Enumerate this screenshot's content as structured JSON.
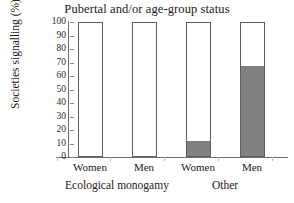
{
  "chart_data": {
    "type": "bar",
    "title": "Pubertal and/or age-group status",
    "xlabel": "",
    "ylabel": "Societies signalling (%)",
    "ylim": [
      0,
      100
    ],
    "ytick_labels": [
      "100",
      "90",
      "80",
      "70",
      "60",
      "50",
      "40",
      "30",
      "20",
      "10",
      "0"
    ],
    "ytick_values": [
      100,
      90,
      80,
      70,
      60,
      50,
      40,
      30,
      20,
      10,
      0
    ],
    "grid": false,
    "legend": "none",
    "categories": [
      "Women",
      "Men",
      "Women",
      "Men"
    ],
    "groups": [
      {
        "label": "Ecological monogamy",
        "categories": [
          "Women",
          "Men"
        ]
      },
      {
        "label": "Other",
        "categories": [
          "Women",
          "Men"
        ]
      }
    ],
    "series": [
      {
        "name": "Signalling (filled)",
        "color": "#808080",
        "values": [
          0,
          0,
          11,
          68
        ]
      },
      {
        "name": "Not signalling (open)",
        "color": "#ffffff",
        "values": [
          100,
          100,
          89,
          32
        ]
      }
    ],
    "bars": [
      {
        "group": "Ecological monogamy",
        "category": "Women",
        "filled": 0,
        "total": 100
      },
      {
        "group": "Ecological monogamy",
        "category": "Men",
        "filled": 0,
        "total": 100
      },
      {
        "group": "Other",
        "category": "Women",
        "filled": 11,
        "total": 100
      },
      {
        "group": "Other",
        "category": "Men",
        "filled": 68,
        "total": 100
      }
    ],
    "colors": {
      "fill": "#808080",
      "open": "#ffffff",
      "outline": "#5e5e5e",
      "axis": "#6f6f6f",
      "text": "#1a1a1a",
      "background": "#ffffff"
    }
  }
}
